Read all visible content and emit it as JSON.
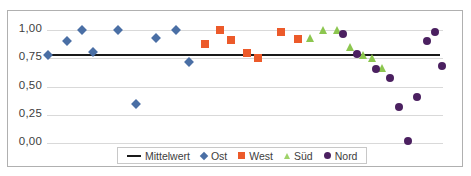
{
  "chart_data": {
    "type": "scatter",
    "title": "",
    "subtitle": "",
    "xlabel": "",
    "ylabel": "",
    "xlim": [
      0,
      40
    ],
    "ylim": [
      0.0,
      1.0
    ],
    "yticks": [
      1.0,
      0.75,
      0.5,
      0.25,
      0.0
    ],
    "ytick_labels": [
      "1,00",
      "0,75",
      "0,50",
      "0,25",
      "0,00"
    ],
    "xticks_visible": false,
    "grid": "horizontal",
    "legend_position": "bottom-center",
    "legend_entries": [
      "Mittelwert",
      "Ost",
      "West",
      "Süd",
      "Nord"
    ],
    "colors": {
      "mittelwert": "#1a1a1a",
      "ost": "#4a6fa5",
      "west": "#ec5a2a",
      "sued": "#8cc64f",
      "nord": "#4b2060",
      "gridline": "#d9d9d9",
      "frame": "#b0b0b0",
      "text": "#3d3d3d",
      "background": "#ffffff"
    },
    "reference_line": {
      "name": "Mittelwert",
      "value": 0.78,
      "x_start": 0.0,
      "x_end": 39.7
    },
    "series": [
      {
        "name": "Ost",
        "marker": "diamond",
        "color": "#4a6fa5",
        "points": [
          {
            "x": 0.1,
            "y": 0.775
          },
          {
            "x": 2.0,
            "y": 0.905
          },
          {
            "x": 3.5,
            "y": 1.0
          },
          {
            "x": 4.6,
            "y": 0.805
          },
          {
            "x": 7.2,
            "y": 1.0
          },
          {
            "x": 9.0,
            "y": 0.345
          },
          {
            "x": 11.0,
            "y": 0.93
          },
          {
            "x": 13.0,
            "y": 1.0
          },
          {
            "x": 14.3,
            "y": 0.72
          }
        ]
      },
      {
        "name": "West",
        "marker": "square",
        "color": "#ec5a2a",
        "points": [
          {
            "x": 16.0,
            "y": 0.88
          },
          {
            "x": 17.5,
            "y": 1.0
          },
          {
            "x": 18.6,
            "y": 0.915
          },
          {
            "x": 20.2,
            "y": 0.795
          },
          {
            "x": 21.3,
            "y": 0.75
          },
          {
            "x": 23.6,
            "y": 0.985
          },
          {
            "x": 25.4,
            "y": 0.92
          }
        ]
      },
      {
        "name": "Süd",
        "marker": "triangle",
        "color": "#8cc64f",
        "points": [
          {
            "x": 26.6,
            "y": 0.925
          },
          {
            "x": 27.9,
            "y": 1.0
          },
          {
            "x": 29.3,
            "y": 1.0
          },
          {
            "x": 30.6,
            "y": 0.85
          },
          {
            "x": 31.9,
            "y": 0.78
          },
          {
            "x": 32.8,
            "y": 0.755
          },
          {
            "x": 33.8,
            "y": 0.665
          }
        ]
      },
      {
        "name": "Nord",
        "marker": "circle",
        "color": "#4b2060",
        "points": [
          {
            "x": 29.9,
            "y": 0.965
          },
          {
            "x": 31.3,
            "y": 0.79
          },
          {
            "x": 33.2,
            "y": 0.655
          },
          {
            "x": 34.6,
            "y": 0.575
          },
          {
            "x": 35.6,
            "y": 0.32
          },
          {
            "x": 36.5,
            "y": 0.015
          },
          {
            "x": 37.4,
            "y": 0.41
          },
          {
            "x": 38.4,
            "y": 0.9
          },
          {
            "x": 39.2,
            "y": 0.98
          },
          {
            "x": 39.9,
            "y": 0.68
          }
        ]
      }
    ]
  },
  "legend": {
    "items": [
      {
        "label": "Mittelwert",
        "swatch": "line-swatch"
      },
      {
        "label": "Ost",
        "swatch": "diamond-swatch"
      },
      {
        "label": "West",
        "swatch": "square-swatch"
      },
      {
        "label": "Süd",
        "swatch": "triangle-swatch"
      },
      {
        "label": "Nord",
        "swatch": "circle-swatch"
      }
    ]
  }
}
